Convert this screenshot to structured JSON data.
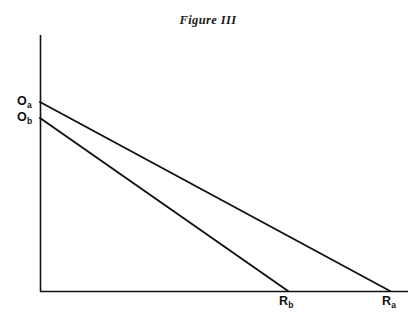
{
  "figure": {
    "title": "Figure III",
    "background_color": "#ffffff",
    "ink_color": "#111111"
  },
  "axes": {
    "y_axis_name": "vertical-axis",
    "x_axis_name": "horizontal-axis",
    "origin_px": [
      40,
      291
    ],
    "y_axis_top_px": [
      40,
      35
    ],
    "x_axis_right_px": [
      408,
      291
    ],
    "ticks": [],
    "grid": false
  },
  "labels": {
    "o_a": {
      "base": "O",
      "sub": "a"
    },
    "o_b": {
      "base": "O",
      "sub": "b"
    },
    "r_b": {
      "base": "R",
      "sub": "b"
    },
    "r_a": {
      "base": "R",
      "sub": "a"
    }
  },
  "chart_data": {
    "type": "line",
    "title": "Figure III",
    "xlabel": "",
    "ylabel": "",
    "xlim": [
      0,
      1
    ],
    "ylim": [
      0,
      1
    ],
    "grid": false,
    "legend": "none",
    "series": [
      {
        "name": "line-a",
        "label": "O_a to R_a",
        "x": [
          0,
          1
        ],
        "y": [
          0.735,
          0
        ],
        "y_intercept_label": "Oa",
        "x_intercept_label": "Ra",
        "pixel_start": [
          40,
          102
        ],
        "pixel_end": [
          390,
          291
        ]
      },
      {
        "name": "line-b",
        "label": "O_b to R_b",
        "x": [
          0,
          0.709
        ],
        "y": [
          0.673,
          0
        ],
        "y_intercept_label": "Ob",
        "x_intercept_label": "Rb",
        "pixel_start": [
          40,
          118
        ],
        "pixel_end": [
          288,
          291
        ]
      }
    ],
    "annotations": [
      {
        "text": "Oa",
        "position": "y-axis-intercept-upper"
      },
      {
        "text": "Ob",
        "position": "y-axis-intercept-lower"
      },
      {
        "text": "Rb",
        "position": "x-axis-intercept-left"
      },
      {
        "text": "Ra",
        "position": "x-axis-intercept-right"
      }
    ]
  }
}
